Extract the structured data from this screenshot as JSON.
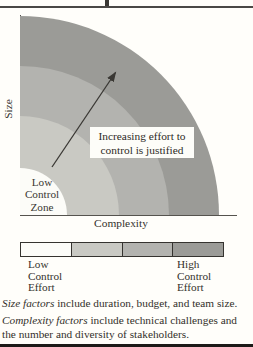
{
  "palette": {
    "zone_white": "#fcfcf8",
    "zone_light": "#c9c9c3",
    "zone_medium": "#b3b3af",
    "zone_dark": "#9b9b97",
    "arrow": "#3a3834",
    "annotation_bg": "#fdfdf9"
  },
  "diagram": {
    "y_axis_label": "Size",
    "x_axis_label": "Complexity",
    "low_control_zone_lines": [
      "Low",
      "Control",
      "Zone"
    ],
    "annotation_lines": [
      "Increasing effort to",
      "control is justified"
    ]
  },
  "legend": {
    "segment_colors": [
      "#fcfcf8",
      "#c9c9c3",
      "#b3b3af",
      "#9b9b97"
    ],
    "left_label_lines": [
      "Low",
      "Control",
      "Effort"
    ],
    "right_label_lines": [
      "High",
      "Control",
      "Effort"
    ]
  },
  "footnotes": {
    "size": {
      "lead": "Size factors",
      "rest": " include duration, budget, and team size."
    },
    "complexity": {
      "lead": "Complexity factors",
      "rest_line1": " include technical challenges and",
      "line2": "the number and diversity of stakeholders."
    }
  }
}
